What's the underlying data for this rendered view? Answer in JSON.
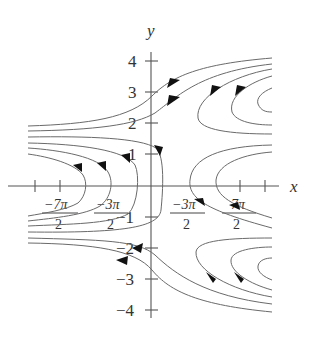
{
  "figure": {
    "type": "phase-portrait",
    "axes": {
      "x_label": "x",
      "y_label": "y",
      "y_ticks": [
        {
          "value": 4,
          "label": "4"
        },
        {
          "value": 3,
          "label": "3"
        },
        {
          "value": 2,
          "label": "2"
        },
        {
          "value": 1,
          "label": "1"
        },
        {
          "value": -1,
          "label": "−1"
        },
        {
          "value": -2,
          "label": "−2"
        },
        {
          "value": -3,
          "label": "−3"
        },
        {
          "value": -4,
          "label": "−4"
        }
      ],
      "x_tick_labels": [
        {
          "num": "−7π",
          "den": "2"
        },
        {
          "num": "−3π",
          "den": "2"
        },
        {
          "num": "−3π",
          "den": "2"
        },
        {
          "num": "7π",
          "den": "2"
        }
      ]
    },
    "colors": {
      "curve": "#6a6a6a",
      "axis": "#555555",
      "arrow": "#111111",
      "text": "#333333",
      "background": "#ffffff"
    }
  }
}
